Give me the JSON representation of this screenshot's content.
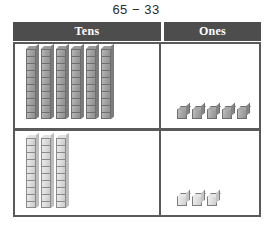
{
  "title": "65 − 33",
  "columns": {
    "tens_label": "Tens",
    "ones_label": "Ones"
  },
  "colors": {
    "header_background": "#4d4d4d",
    "header_text": "#ffffff",
    "grid_border": "#5a5a5a",
    "block_dark": "#a3a3a3",
    "block_light": "#dcdcdc",
    "page_background": "#ffffff"
  },
  "chart_data": {
    "type": "table",
    "title": "65 − 33",
    "categories": [
      "Tens",
      "Ones"
    ],
    "series": [
      {
        "name": "minuend",
        "label": "65",
        "values": [
          6,
          5
        ],
        "shade": "dark"
      },
      {
        "name": "subtrahend",
        "label": "33",
        "values": [
          3,
          3
        ],
        "shade": "light"
      }
    ],
    "unit_per_rod": 10,
    "unit_per_cube": 1
  },
  "rows": [
    {
      "name": "minuend-row",
      "number": "65",
      "tens_count": 6,
      "ones_count": 5,
      "shade": "dark",
      "segments_per_rod": 10
    },
    {
      "name": "subtrahend-row",
      "number": "33",
      "tens_count": 3,
      "ones_count": 3,
      "shade": "light",
      "segments_per_rod": 10
    }
  ]
}
